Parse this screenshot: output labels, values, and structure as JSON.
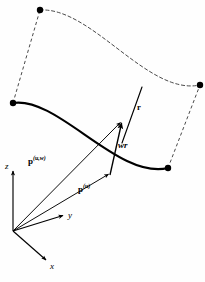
{
  "figure": {
    "domain": "diagram",
    "background_color": "#fefefe",
    "ink_color": "#000000",
    "dash_color": "#555555"
  },
  "labels": {
    "p_uw": {
      "base": "p",
      "superscript": "(u,w)",
      "name": "vector-p-uw"
    },
    "p_u": {
      "base": "p",
      "superscript": "(u)",
      "name": "vector-p-u"
    },
    "wr": "wr",
    "r": "r",
    "axis_x": "x",
    "axis_y": "y",
    "axis_z": "z"
  },
  "geometry": {
    "origin": {
      "x": 13,
      "y": 231
    },
    "solid_curve": {
      "start": {
        "x": 13,
        "y": 103
      },
      "end": {
        "x": 168,
        "y": 168
      },
      "control_1": {
        "x": 58,
        "y": 96
      },
      "control_2": {
        "x": 118,
        "y": 180
      },
      "stroke_width": 2.1
    },
    "dashed_curve": {
      "start": {
        "x": 40,
        "y": 10
      },
      "end": {
        "x": 200,
        "y": 85
      },
      "control_1": {
        "x": 92,
        "y": 7
      },
      "control_2": {
        "x": 148,
        "y": 96
      },
      "stroke_width": 1
    },
    "ruling_left": {
      "x1": 13,
      "y1": 103,
      "x2": 40,
      "y2": 10
    },
    "ruling_right": {
      "x1": 168,
      "y1": 168,
      "x2": 200,
      "y2": 85
    },
    "ruling_mid": {
      "x1": 122,
      "y1": 143,
      "x2": 142,
      "y2": 87
    },
    "vector_wr": {
      "x1": 110,
      "y1": 175,
      "x2": 122,
      "y2": 121
    },
    "vector_p_uw": {
      "x1": 13,
      "y1": 231,
      "x2": 122,
      "y2": 121
    },
    "vector_p_u": {
      "x1": 13,
      "y1": 231,
      "x2": 110,
      "y2": 175
    },
    "axis_z_vec": {
      "x1": 13,
      "y1": 231,
      "x2": 13,
      "y2": 169
    },
    "axis_y_vec": {
      "x1": 13,
      "y1": 231,
      "x2": 65,
      "y2": 215
    },
    "axis_x_vec": {
      "x1": 13,
      "y1": 231,
      "x2": 48,
      "y2": 262
    },
    "dots": [
      {
        "x": 40,
        "y": 10,
        "r": 3.2,
        "name": "dot-offset-curve-start"
      },
      {
        "x": 200,
        "y": 85,
        "r": 3.2,
        "name": "dot-offset-curve-end"
      },
      {
        "x": 13,
        "y": 103,
        "r": 3.2,
        "name": "dot-base-curve-start"
      },
      {
        "x": 168,
        "y": 168,
        "r": 3.2,
        "name": "dot-base-curve-end"
      }
    ]
  }
}
